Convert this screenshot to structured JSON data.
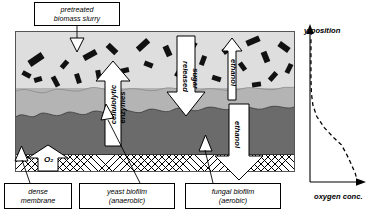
{
  "diagram": {
    "callouts": [
      {
        "id": "slurry",
        "lines": [
          "pretreated",
          "biomass slurry"
        ]
      },
      {
        "id": "membrane",
        "lines": [
          "dense",
          "membrane"
        ]
      },
      {
        "id": "yeast",
        "lines": [
          "yeast biofilm",
          "(anaerobic)"
        ]
      },
      {
        "id": "fungal",
        "lines": [
          "fungal biofilm",
          "(aerobic)"
        ]
      }
    ],
    "layers": [
      {
        "name": "pretreated biomass slurry",
        "color": "#dedede"
      },
      {
        "name": "yeast biofilm (anaerobic)",
        "color": "#b4b4b4"
      },
      {
        "name": "fungal biofilm (aerobic)",
        "color": "#6b6b6b"
      },
      {
        "name": "dense membrane",
        "color": "#ffffff"
      }
    ],
    "flow_arrows": [
      {
        "label": "cellulolytic enzymes",
        "direction": "up",
        "orientation": "vertical"
      },
      {
        "label": "released sugar",
        "direction": "down",
        "orientation": "vertical"
      },
      {
        "label": "ethanol",
        "direction": "up",
        "orientation": "vertical"
      },
      {
        "label": "ethanol",
        "direction": "down",
        "orientation": "vertical"
      },
      {
        "label": "O₂",
        "direction": "up",
        "orientation": "vertical"
      }
    ],
    "arrow_labels": {
      "cellulolytic": "cellulolytic",
      "enzymes": "enzymes",
      "released": "released",
      "sugar": "sugar",
      "ethanol_up": "ethanol",
      "ethanol_down": "ethanol",
      "oxygen": "O₂"
    }
  },
  "chart_data": {
    "type": "line",
    "title": "",
    "xlabel": "oxygen conc.",
    "ylabel": "y-position",
    "grid": false,
    "legend": null,
    "series": [
      {
        "name": "oxygen concentration profile",
        "style": "dashed",
        "x": [
          0.02,
          0.02,
          0.03,
          0.06,
          0.14,
          0.3,
          0.5,
          0.66,
          0.76,
          0.86,
          0.95,
          1.0
        ],
        "y": [
          1.0,
          0.72,
          0.62,
          0.54,
          0.46,
          0.38,
          0.31,
          0.26,
          0.2,
          0.13,
          0.06,
          0.0
        ]
      }
    ],
    "xlim": [
      0,
      1.05
    ],
    "ylim": [
      0,
      1.05
    ],
    "note": "oxygen decreases from membrane (bottom) to bulk slurry (top)"
  }
}
